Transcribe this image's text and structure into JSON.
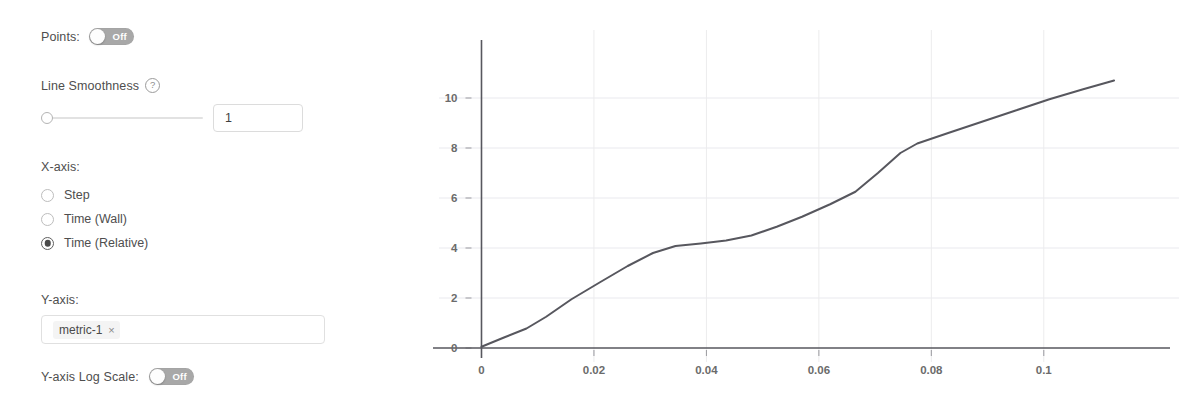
{
  "settings": {
    "points": {
      "label": "Points:",
      "toggle_state": "Off",
      "enabled": false
    },
    "line_smoothness": {
      "label": "Line Smoothness",
      "help_icon": "question-mark-circle-icon",
      "value": "1",
      "slider_position_pct": 0
    },
    "x_axis": {
      "title": "X-axis:",
      "options": [
        {
          "label": "Step",
          "selected": false
        },
        {
          "label": "Time (Wall)",
          "selected": false
        },
        {
          "label": "Time (Relative)",
          "selected": true
        }
      ]
    },
    "y_axis": {
      "title": "Y-axis:",
      "chips": [
        {
          "label": "metric-1",
          "remove_icon": "×"
        }
      ]
    },
    "y_log_scale": {
      "label": "Y-axis Log Scale:",
      "toggle_state": "Off",
      "enabled": false
    }
  },
  "chart_data": {
    "type": "line",
    "title": "",
    "xlabel": "",
    "ylabel": "",
    "xlim": [
      -0.004,
      0.118
    ],
    "ylim": [
      0,
      11.6
    ],
    "grid": true,
    "legend": false,
    "xticks": [
      0,
      0.02,
      0.04,
      0.06,
      0.08,
      0.1
    ],
    "xtick_labels": [
      "0",
      "0.02",
      "0.04",
      "0.06",
      "0.08",
      "0.1"
    ],
    "yticks": [
      0,
      2,
      4,
      6,
      8,
      10
    ],
    "ytick_labels": [
      "0",
      "2",
      "4",
      "6",
      "8",
      "10"
    ],
    "line_color": "#57575e",
    "series": [
      {
        "name": "metric-1",
        "x": [
          0.0,
          0.004,
          0.008,
          0.0115,
          0.016,
          0.021,
          0.026,
          0.0305,
          0.0345,
          0.039,
          0.0435,
          0.048,
          0.0525,
          0.057,
          0.062,
          0.0665,
          0.0705,
          0.0745,
          0.0775,
          0.083,
          0.089,
          0.095,
          0.101,
          0.107,
          0.1125
        ],
        "y": [
          0.05,
          0.42,
          0.78,
          1.25,
          1.95,
          2.62,
          3.28,
          3.8,
          4.08,
          4.18,
          4.3,
          4.5,
          4.85,
          5.25,
          5.75,
          6.25,
          7.0,
          7.8,
          8.18,
          8.6,
          9.05,
          9.5,
          9.95,
          10.35,
          10.7
        ]
      }
    ]
  }
}
